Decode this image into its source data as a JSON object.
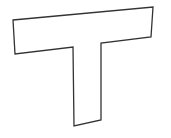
{
  "figure": {
    "shape": "T-letter-outline",
    "stroke_color": "#333333",
    "fill_color": "#ffffff",
    "points": "13,20 153,7 151,37 101,43 101,120 74,126 73,47 15,54"
  }
}
